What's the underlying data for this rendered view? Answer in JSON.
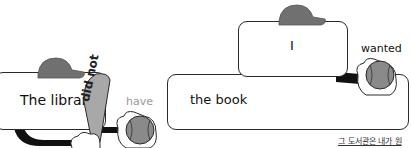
{
  "diagram": {
    "sentence1": {
      "subject": "The library",
      "negation": "did not",
      "verb": "have"
    },
    "sentence2": {
      "object": "the book",
      "subject": "I",
      "verb": "wanted"
    },
    "caption": "그 도서관은 내가 원",
    "colors": {
      "cap": "#707070",
      "ball": "#8a8a8a",
      "bat": "#a8a8a8",
      "outline": "#2a2a2a",
      "verb_faded": "#999999"
    }
  }
}
